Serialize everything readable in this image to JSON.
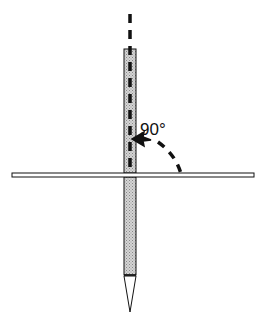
{
  "diagram": {
    "angle_label": "90°",
    "colors": {
      "stroke": "#111111",
      "rod_fill": "#c8c8c8",
      "background": "#ffffff"
    }
  }
}
